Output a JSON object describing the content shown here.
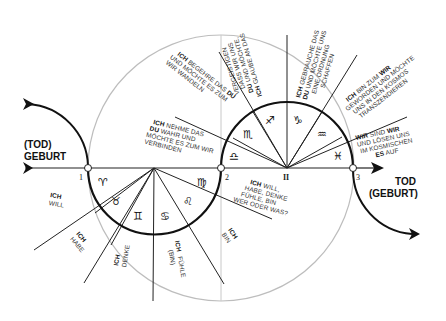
{
  "diagram": {
    "left_label": {
      "line1": "(TOD)",
      "line2": "GEBURT"
    },
    "right_label": {
      "line1": "TOD",
      "line2": "(GEBURT)"
    },
    "points": {
      "p1": "1",
      "p2": "2",
      "p3": "3",
      "center_upper": "II"
    },
    "signs": {
      "aries": "♈",
      "taurus": "♉",
      "gemini": "♊",
      "cancer": "♋",
      "leo": "♌",
      "virgo": "♍",
      "libra": "♎",
      "scorpio": "♏",
      "sagittarius": "♐",
      "capricorn": "♑",
      "aquarius": "♒",
      "pisces": "♓"
    },
    "lower_statements": [
      {
        "bold": "ICH",
        "text": "WILL"
      },
      {
        "bold": "ICH",
        "text": "HABE"
      },
      {
        "bold": "ICH",
        "text": "DENKE"
      },
      {
        "bold": "ICH",
        "text": "FÜHLE",
        "extra": "(BIN)"
      },
      {
        "bold": "ICH",
        "text": "BIN"
      }
    ],
    "center_statement": {
      "bold": "ICH",
      "l1": "WILL,",
      "l2": "HABE, DENKE",
      "l3": "FÜHLE, BIN",
      "l4": "WER ODER WAS?"
    },
    "upper_statements": {
      "libra": {
        "b1": "ICH",
        "l1": "NEHME DAS",
        "b2": "DU",
        "l2": "WAHR UND",
        "l3": "MÖCHTE ES ZUM WIR",
        "l4": "VERBINDEN"
      },
      "scorpio": {
        "b1": "ICH",
        "l1": "BEGEHRE DAS",
        "b2": "DU",
        "l2": "UND MÖCHTE ES ZUM",
        "l3": "WIR WANDELN"
      },
      "sagittarius": {
        "b1": "ICH",
        "l1": "GLAUBE AN DAS",
        "b2": "DU",
        "l2": "UND MÖCHTE,",
        "l3": "DASS WIR UNS",
        "l4": "VERGEISTIGEN"
      },
      "capricorn": {
        "b1": "ICH",
        "l1": "GEBRAUCHE DAS",
        "b2": "DU",
        "l2": "UND MÖCHTE UNS",
        "l3": "EINE ORDNUNG",
        "l4": "SCHAFFEN"
      },
      "aquarius": {
        "b1": "ICH",
        "l1": "BIN ZUM",
        "b2": "WIR",
        "l2": "GEWORDEN UND MÖCHTE",
        "l3": "UNS IN DEN KOSMOS",
        "l4": "TRANSZENDIEREN"
      },
      "pisces": {
        "b1": "WIR",
        "l1": "SIND",
        "b2": "WIR",
        "l2": "UND LÖSEN UNS",
        "l3": "IM KOSMISCHEN",
        "b3": "ES",
        "l4": "AUF"
      }
    }
  }
}
